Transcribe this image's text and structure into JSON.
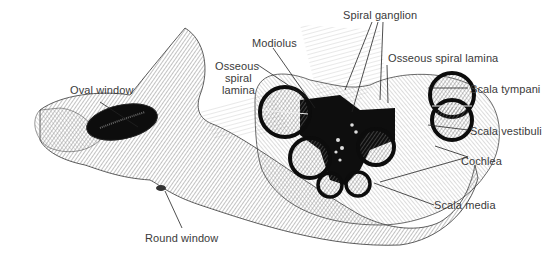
{
  "figure": {
    "labels": {
      "spiral_ganglion": "Spiral ganglion",
      "modiolus": "Modiolus",
      "osseous_spiral_lamina_left_l1": "Osseous",
      "osseous_spiral_lamina_left_l2": "spiral",
      "osseous_spiral_lamina_left_l3": "lamina",
      "osseous_spiral_lamina_right": "Osseous spiral lamina",
      "oval_window": "Oval window",
      "scala_tympani": "Scala tympani",
      "scala_vestibuli": "Scala vestibuli",
      "cochlea": "Cochlea",
      "scala_media": "Scala media",
      "round_window": "Round window"
    },
    "colors": {
      "background": "#ffffff",
      "ink": "#111111",
      "hatch": "#8a8a8a",
      "label_text": "#3a3a3a"
    }
  }
}
